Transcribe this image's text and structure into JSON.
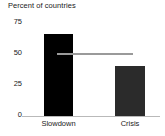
{
  "chart_data": {
    "type": "bar",
    "title": "Percent of countries",
    "xlabel": "",
    "ylabel": "",
    "categories": [
      "Slowdown",
      "Crisis"
    ],
    "values": [
      65,
      40
    ],
    "ylim": [
      0,
      75
    ],
    "yticks": [
      0,
      25,
      50,
      75
    ],
    "ytick_labels": [
      "0",
      "25",
      "50",
      "75"
    ],
    "grid": false,
    "legend": "none",
    "bar_colors": [
      "#000000",
      "#2b2b2b"
    ],
    "annotations": [
      {
        "name": "reference-line",
        "type": "horizontal-line",
        "value": 50,
        "color": "#9a9a9a"
      }
    ],
    "axis_color": "#b9b9b9",
    "text_color": "#1a1a1a",
    "background": "#ffffff"
  }
}
